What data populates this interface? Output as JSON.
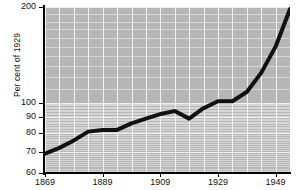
{
  "chart_data": {
    "type": "line",
    "title": "",
    "subtitle": "",
    "xlabel": "",
    "ylabel": "Per cent of 1929",
    "yscale": "log",
    "ylim": [
      60,
      200
    ],
    "xlim": [
      1869,
      1954
    ],
    "grid": true,
    "legend": null,
    "y_ticks": [
      {
        "value": 200,
        "label": "200"
      },
      {
        "value": 100,
        "label": "100"
      },
      {
        "value": 90,
        "label": "90"
      },
      {
        "value": 80,
        "label": "80"
      },
      {
        "value": 70,
        "label": "70"
      },
      {
        "value": 60,
        "label": "60"
      }
    ],
    "x_ticks": [
      {
        "value": 1869,
        "label": "1869"
      },
      {
        "value": 1889,
        "label": "1889"
      },
      {
        "value": 1909,
        "label": "1909"
      },
      {
        "value": 1929,
        "label": "1929"
      },
      {
        "value": 1949,
        "label": "1949"
      }
    ],
    "series": [
      {
        "name": "Index",
        "color": "#111111",
        "x": [
          1869,
          1874,
          1879,
          1884,
          1889,
          1894,
          1899,
          1904,
          1909,
          1914,
          1919,
          1924,
          1929,
          1934,
          1939,
          1944,
          1949,
          1954
        ],
        "values": [
          69,
          72,
          76,
          81,
          82,
          82,
          86,
          89,
          92,
          94,
          89,
          96,
          101,
          101,
          108,
          124,
          150,
          197
        ]
      }
    ],
    "colors": {
      "plot_background": "#b6b6b6",
      "gridline": "#f2f2f2",
      "axis": "#000000",
      "line": "#111111",
      "page_background": "#ffffff",
      "text": "#111111"
    }
  }
}
